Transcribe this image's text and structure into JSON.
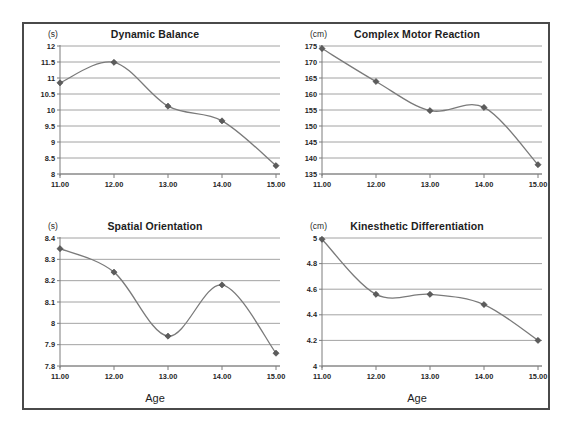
{
  "figure": {
    "border_color": "#4a4a4a",
    "background": "#ffffff",
    "line_color": "#7a7a7a",
    "marker_color": "#5c5c5c",
    "grid_color": "#8c8c8c"
  },
  "panels": [
    {
      "id": "dynamic-balance",
      "title": "Dynamic Balance",
      "unit": "(s)",
      "axis_caption": ""
    },
    {
      "id": "complex-motor-reaction",
      "title": "Complex Motor Reaction",
      "unit": "(cm)",
      "axis_caption": ""
    },
    {
      "id": "spatial-orientation",
      "title": "Spatial Orientation",
      "unit": "(s)",
      "axis_caption": "Age"
    },
    {
      "id": "kinesthetic-differentiation",
      "title": "Kinesthetic Differentiation",
      "unit": "(cm)",
      "axis_caption": "Age"
    }
  ],
  "chart_data": [
    {
      "type": "line",
      "title": "Dynamic Balance",
      "xlabel": "Age",
      "ylabel": "(s)",
      "x": [
        11,
        12,
        13,
        14,
        15
      ],
      "xtick_labels": [
        "11.00",
        "12.00",
        "13.00",
        "14.00",
        "15.00"
      ],
      "values": [
        10.85,
        11.49,
        10.12,
        9.66,
        8.26
      ],
      "ytick_labels": [
        "12",
        "11.5",
        "11",
        "10.5",
        "10",
        "9.5",
        "9",
        "8.5",
        "8"
      ],
      "yticks": [
        12,
        11.5,
        11,
        10.5,
        10,
        9.5,
        9,
        8.5,
        8
      ],
      "ylim": [
        8,
        12
      ],
      "xlim": [
        11,
        15
      ],
      "grid": true,
      "legend": "none",
      "smoothing": "spline"
    },
    {
      "type": "line",
      "title": "Complex Motor Reaction",
      "xlabel": "Age",
      "ylabel": "(cm)",
      "x": [
        11,
        12,
        13,
        14,
        15
      ],
      "xtick_labels": [
        "11.00",
        "12.00",
        "13.00",
        "14.00",
        "15.00"
      ],
      "values": [
        174.2,
        163.9,
        154.8,
        155.8,
        137.9
      ],
      "ytick_labels": [
        "175",
        "170",
        "165",
        "160",
        "155",
        "150",
        "145",
        "140",
        "135"
      ],
      "yticks": [
        175,
        170,
        165,
        160,
        155,
        150,
        145,
        140,
        135
      ],
      "ylim": [
        135,
        175
      ],
      "xlim": [
        11,
        15
      ],
      "grid": true,
      "legend": "none",
      "smoothing": "spline"
    },
    {
      "type": "line",
      "title": "Spatial Orientation",
      "xlabel": "Age",
      "ylabel": "(s)",
      "x": [
        11,
        12,
        13,
        14,
        15
      ],
      "xtick_labels": [
        "11.00",
        "12.00",
        "13.00",
        "14.00",
        "15.00"
      ],
      "values": [
        8.35,
        8.24,
        7.94,
        8.18,
        7.86
      ],
      "ytick_labels": [
        "8.4",
        "8.3",
        "8.2",
        "8.1",
        "8",
        "7.9",
        "7.8"
      ],
      "yticks": [
        8.4,
        8.3,
        8.2,
        8.1,
        8,
        7.9,
        7.8
      ],
      "ylim": [
        7.8,
        8.4
      ],
      "xlim": [
        11,
        15
      ],
      "grid": true,
      "legend": "none",
      "smoothing": "spline"
    },
    {
      "type": "line",
      "title": "Kinesthetic Differentiation",
      "xlabel": "Age",
      "ylabel": "(cm)",
      "x": [
        11,
        12,
        13,
        14,
        15
      ],
      "xtick_labels": [
        "11.00",
        "12.00",
        "13.00",
        "14.00",
        "15.00"
      ],
      "values": [
        4.99,
        4.56,
        4.56,
        4.48,
        4.2
      ],
      "ytick_labels": [
        "5",
        "4.8",
        "4.6",
        "4.4",
        "4.2",
        "4"
      ],
      "yticks": [
        5,
        4.8,
        4.6,
        4.4,
        4.2,
        4
      ],
      "ylim": [
        4,
        5
      ],
      "xlim": [
        11,
        15
      ],
      "grid": true,
      "legend": "none",
      "smoothing": "spline"
    }
  ]
}
